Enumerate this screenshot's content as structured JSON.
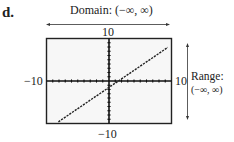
{
  "part_label": "d.",
  "domain": {
    "label": "Domain: (−∞, ∞)"
  },
  "range": {
    "title": "Range:",
    "interval": "(−∞, ∞)"
  },
  "window": {
    "ymax_label": "10",
    "ymin_label": "−10",
    "xmin_label": "−10",
    "xmax_label": "10"
  },
  "chart_data": {
    "type": "line",
    "title": "",
    "xlabel": "",
    "ylabel": "",
    "xlim": [
      -10,
      10
    ],
    "ylim": [
      -10,
      10
    ],
    "grid": false,
    "x_tick_step": 1,
    "y_tick_step": 1,
    "tick_labels": {
      "xmin": "−10",
      "xmax": "10",
      "ymin": "−10",
      "ymax": "10"
    },
    "series": [
      {
        "name": "f(x)",
        "style": "dashed (calculator pixels)",
        "x": [
          -8.1,
          9.4
        ],
        "y": [
          -9.6,
          7.9
        ]
      }
    ],
    "annotations": [
      {
        "text": "Domain: (−∞, ∞)",
        "position": "top, with horizontal double arrow"
      },
      {
        "text": "Range: (−∞, ∞)",
        "position": "right, with vertical double arrow"
      }
    ],
    "estimated_equation": "y ≈ x − 1.5"
  }
}
